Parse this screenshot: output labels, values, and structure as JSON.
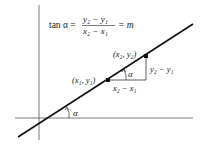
{
  "formula": {
    "lhs": "tan α =",
    "numerator": "y₂ − y₁",
    "denominator": "x₂ − x₁",
    "rhs": "= m"
  },
  "points": {
    "p1": "(x₁, y₁)",
    "p2": "(x₂, y₂)"
  },
  "labels": {
    "run": "x₂ − x₁",
    "rise": "y₂ − y₁",
    "angle_triangle": "α",
    "angle_axis": "α"
  },
  "colors": {
    "line": "#111111",
    "axes": "#555555",
    "background": "#ffffff"
  }
}
